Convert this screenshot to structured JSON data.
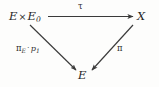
{
  "diagram": {
    "type": "commutative-triangle",
    "background_color": "#fdfdfc",
    "ink_color": "#2b2b2b",
    "nodes": [
      {
        "id": "top-left",
        "base": "E",
        "operator": "×",
        "second": "E",
        "second_subscript": "0",
        "full_text": "E × E₀"
      },
      {
        "id": "top-right",
        "full_text": "X"
      },
      {
        "id": "bottom",
        "full_text": "E"
      }
    ],
    "arrows": [
      {
        "id": "top-horizontal",
        "from": "top-left",
        "to": "top-right",
        "label": "τ",
        "label_position": "above"
      },
      {
        "id": "left-diagonal",
        "from": "top-left",
        "to": "bottom",
        "label_greek": "π",
        "label_subscript": "E",
        "label_dot": "·",
        "label_tail": "p",
        "label_tail_subscript": "1",
        "label_full": "πₑ · p₁",
        "label_position": "left"
      },
      {
        "id": "right-diagonal",
        "from": "top-right",
        "to": "bottom",
        "label": "π",
        "label_position": "right"
      }
    ]
  }
}
